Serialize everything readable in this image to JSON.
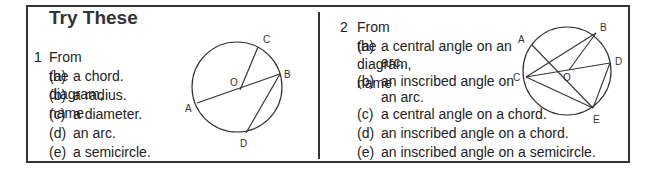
{
  "title": "Try These",
  "questions": [
    {
      "number": "1",
      "stem": "From the diagram, name",
      "items": [
        {
          "label": "(a)",
          "text": "a chord."
        },
        {
          "label": "(b)",
          "text": "a radius."
        },
        {
          "label": "(c)",
          "text": "a diameter."
        },
        {
          "label": "(d)",
          "text": "an arc."
        },
        {
          "label": "(e)",
          "text": "a semicircle."
        }
      ],
      "diagram": {
        "points": [
          "A",
          "B",
          "C",
          "D",
          "O"
        ]
      }
    },
    {
      "number": "2",
      "stem": "From the diagram, name",
      "items": [
        {
          "label": "(a)",
          "text": "a central angle on an",
          "cont": "arc."
        },
        {
          "label": "(b)",
          "text": "an inscribed angle on",
          "cont": "an arc."
        },
        {
          "label": "(c)",
          "text": "a central angle on a chord."
        },
        {
          "label": "(d)",
          "text": "an inscribed angle on a chord."
        },
        {
          "label": "(e)",
          "text": "an inscribed angle on a semicircle."
        }
      ],
      "diagram": {
        "points": [
          "A",
          "B",
          "C",
          "D",
          "E",
          "O"
        ]
      }
    }
  ]
}
